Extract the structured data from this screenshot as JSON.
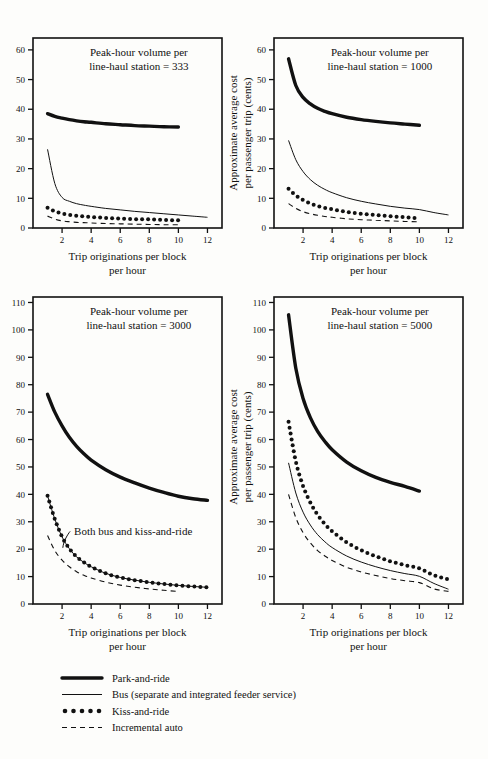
{
  "figure": {
    "background": "#fdfdfb",
    "ink": "#111111"
  },
  "axis_common": {
    "xlabel_line1": "Trip originations per block",
    "xlabel_line2": "per hour",
    "ylabel_line1": "Approximate average cost",
    "ylabel_line2": "per passenger trip (cents)",
    "xticks": [
      2,
      4,
      6,
      8,
      10,
      12
    ],
    "xlim": [
      0,
      13
    ],
    "grid": false
  },
  "legend": {
    "position": "bottom-left",
    "items": [
      {
        "key": "park",
        "label": "Park-and-ride",
        "style": "thick-solid"
      },
      {
        "key": "bus",
        "label": "Bus (separate and integrated feeder service)",
        "style": "thin-solid"
      },
      {
        "key": "kiss",
        "label": "Kiss-and-ride",
        "style": "dotted-markers"
      },
      {
        "key": "auto",
        "label": "Incremental auto",
        "style": "dashed"
      }
    ]
  },
  "chart_data": [
    {
      "id": "panel-333",
      "type": "line",
      "title": "Peak-hour volume per line-haul station = 333",
      "title_line1": "Peak-hour volume per",
      "title_line2": "line-haul station = 333",
      "xlabel": "Trip originations per block per hour",
      "ylabel": "Approximate average cost per passenger trip (cents)",
      "xlim": [
        0,
        13
      ],
      "ylim": [
        0,
        64
      ],
      "yticks": [
        0,
        10,
        20,
        30,
        40,
        50,
        60
      ],
      "xticks": [
        2,
        4,
        6,
        8,
        10,
        12
      ],
      "x": [
        1,
        1.5,
        2,
        2.5,
        3,
        3.5,
        4,
        5,
        6,
        7,
        8,
        9,
        10,
        11,
        12
      ],
      "series": [
        {
          "name": "Park-and-ride",
          "values": [
            38.5,
            37.6,
            37.0,
            36.5,
            36.1,
            35.8,
            35.6,
            35.1,
            34.8,
            34.5,
            34.3,
            34.1,
            34.0,
            null,
            null
          ]
        },
        {
          "name": "Bus (separate and integrated feeder service)",
          "values": [
            26.5,
            15.0,
            10.3,
            9.0,
            8.2,
            7.7,
            7.3,
            6.6,
            6.1,
            5.6,
            5.2,
            4.8,
            4.4,
            4.0,
            3.6
          ]
        },
        {
          "name": "Kiss-and-ride",
          "values": [
            6.8,
            5.6,
            4.9,
            4.4,
            4.1,
            3.9,
            3.7,
            3.4,
            3.2,
            3.0,
            2.9,
            2.7,
            2.6,
            null,
            null
          ]
        },
        {
          "name": "Incremental auto",
          "values": [
            4.0,
            3.0,
            2.4,
            2.1,
            1.9,
            1.8,
            1.7,
            1.5,
            1.4,
            1.3,
            1.2,
            1.1,
            1.1,
            null,
            null
          ]
        }
      ]
    },
    {
      "id": "panel-1000",
      "type": "line",
      "title": "Peak-hour volume per line-haul station = 1000",
      "title_line1": "Peak-hour volume per",
      "title_line2": "line-haul station = 1000",
      "xlabel": "Trip originations per block per hour",
      "ylabel": "Approximate average cost per passenger trip (cents)",
      "xlim": [
        0,
        13
      ],
      "ylim": [
        0,
        64
      ],
      "yticks": [
        0,
        10,
        20,
        30,
        40,
        50,
        60
      ],
      "xticks": [
        2,
        4,
        6,
        8,
        10,
        12
      ],
      "x": [
        1,
        1.5,
        2,
        2.5,
        3,
        3.5,
        4,
        5,
        6,
        7,
        8,
        9,
        10,
        11,
        12
      ],
      "series": [
        {
          "name": "Park-and-ride",
          "values": [
            57.0,
            48.0,
            44.0,
            41.8,
            40.3,
            39.3,
            38.5,
            37.3,
            36.5,
            35.9,
            35.4,
            35.0,
            34.6,
            null,
            null
          ]
        },
        {
          "name": "Bus (separate and integrated feeder service)",
          "values": [
            29.5,
            23.0,
            19.0,
            16.3,
            14.4,
            13.0,
            11.9,
            10.2,
            9.0,
            8.1,
            7.3,
            6.7,
            6.2,
            5.2,
            4.4
          ]
        },
        {
          "name": "Kiss-and-ride",
          "values": [
            13.2,
            11.0,
            9.4,
            8.3,
            7.4,
            6.8,
            6.3,
            5.4,
            4.8,
            4.4,
            4.0,
            3.6,
            3.2,
            null,
            null
          ]
        },
        {
          "name": "Incremental auto",
          "values": [
            8.2,
            6.6,
            5.5,
            4.8,
            4.3,
            3.9,
            3.6,
            3.1,
            2.8,
            2.6,
            2.4,
            2.2,
            2.1,
            null,
            null
          ]
        }
      ]
    },
    {
      "id": "panel-3000",
      "type": "line",
      "title": "Peak-hour volume per line-haul station = 3000",
      "title_line1": "Peak-hour volume per",
      "title_line2": "line-haul station = 3000",
      "xlabel": "Trip originations per block per hour",
      "ylabel": "Approximate average cost per passenger trip (cents)",
      "xlim": [
        0,
        13
      ],
      "ylim": [
        0,
        112
      ],
      "yticks": [
        0,
        10,
        20,
        30,
        40,
        50,
        60,
        70,
        80,
        90,
        100,
        110
      ],
      "xticks": [
        2,
        4,
        6,
        8,
        10,
        12
      ],
      "annotation": "Both bus and kiss-and-ride",
      "x": [
        1,
        1.5,
        2,
        2.5,
        3,
        3.5,
        4,
        5,
        6,
        7,
        8,
        9,
        10,
        11,
        12
      ],
      "series": [
        {
          "name": "Park-and-ride",
          "values": [
            76.5,
            70.0,
            65.0,
            60.8,
            57.5,
            54.8,
            52.5,
            49.0,
            46.3,
            44.2,
            42.3,
            40.7,
            39.3,
            38.4,
            37.8
          ]
        },
        {
          "name": "Both bus and kiss-and-ride",
          "values": [
            39.5,
            31.0,
            24.5,
            20.2,
            17.2,
            15.2,
            13.6,
            11.2,
            9.7,
            8.7,
            7.9,
            7.3,
            6.8,
            6.4,
            6.1
          ]
        },
        {
          "name": "Incremental auto",
          "values": [
            25.0,
            19.5,
            16.0,
            13.6,
            11.8,
            10.5,
            9.5,
            8.0,
            6.9,
            6.1,
            5.5,
            5.0,
            4.6,
            null,
            null
          ]
        }
      ]
    },
    {
      "id": "panel-5000",
      "type": "line",
      "title": "Peak-hour volume per line-haul station = 5000",
      "title_line1": "Peak-hour volume per",
      "title_line2": "line-haul station = 5000",
      "xlabel": "Trip originations per block per hour",
      "ylabel": "Approximate average cost per passenger trip (cents)",
      "xlim": [
        0,
        13
      ],
      "ylim": [
        0,
        112
      ],
      "yticks": [
        0,
        10,
        20,
        30,
        40,
        50,
        60,
        70,
        80,
        90,
        100,
        110
      ],
      "xticks": [
        2,
        4,
        6,
        8,
        10,
        12
      ],
      "x": [
        1,
        1.5,
        2,
        2.5,
        3,
        3.5,
        4,
        5,
        6,
        7,
        8,
        9,
        10,
        11,
        12
      ],
      "series": [
        {
          "name": "Park-and-ride",
          "values": [
            105.5,
            86.0,
            75.0,
            68.0,
            63.0,
            59.3,
            56.3,
            51.8,
            48.6,
            46.2,
            44.4,
            42.9,
            41.2,
            null,
            null
          ]
        },
        {
          "name": "Bus (separate and integrated feeder service)",
          "values": [
            51.5,
            40.5,
            33.5,
            28.8,
            25.3,
            22.7,
            20.6,
            17.5,
            15.3,
            13.6,
            12.2,
            11.1,
            10.1,
            7.5,
            5.4
          ]
        },
        {
          "name": "Kiss-and-ride",
          "values": [
            66.5,
            52.0,
            43.0,
            37.0,
            32.5,
            29.2,
            26.5,
            22.5,
            19.6,
            17.4,
            15.6,
            14.2,
            13.0,
            10.5,
            9.0
          ]
        },
        {
          "name": "Incremental auto",
          "values": [
            40.0,
            31.5,
            26.0,
            22.3,
            19.5,
            17.5,
            15.9,
            13.4,
            11.7,
            10.4,
            9.3,
            8.5,
            7.8,
            5.5,
            4.6
          ]
        }
      ]
    }
  ]
}
